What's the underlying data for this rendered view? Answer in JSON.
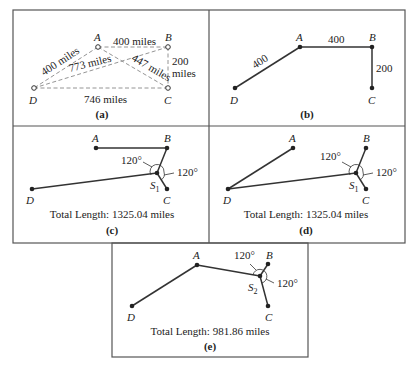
{
  "panels": {
    "a": {
      "caption": "(a)",
      "nodes": {
        "A": "A",
        "B": "B",
        "C": "C",
        "D": "D"
      },
      "edge_labels": {
        "AB": "400 miles",
        "AD": "400 miles",
        "BD": "773 miles",
        "AC": "447 miles",
        "BC_1": "200",
        "BC_2": "miles",
        "DC": "746 miles"
      }
    },
    "b": {
      "caption": "(b)",
      "nodes": {
        "A": "A",
        "B": "B",
        "C": "C",
        "D": "D"
      },
      "edge_labels": {
        "AD": "400",
        "AB": "400",
        "BC": "200"
      }
    },
    "c": {
      "caption": "(c)",
      "nodes": {
        "A": "A",
        "B": "B",
        "C": "C",
        "D": "D",
        "S": "S",
        "S_sub": "1"
      },
      "angle1": "120°",
      "angle2": "120°",
      "total": "Total Length: 1325.04 miles"
    },
    "d": {
      "caption": "(d)",
      "nodes": {
        "A": "A",
        "B": "B",
        "C": "C",
        "D": "D",
        "S": "S",
        "S_sub": "1"
      },
      "angle1": "120°",
      "angle2": "120°",
      "total": "Total Length: 1325.04 miles"
    },
    "e": {
      "caption": "(e)",
      "nodes": {
        "A": "A",
        "B": "B",
        "C": "C",
        "D": "D",
        "S": "S",
        "S_sub": "2"
      },
      "angle1": "120°",
      "angle2": "120°",
      "total": "Total Length: 981.86 miles"
    }
  }
}
